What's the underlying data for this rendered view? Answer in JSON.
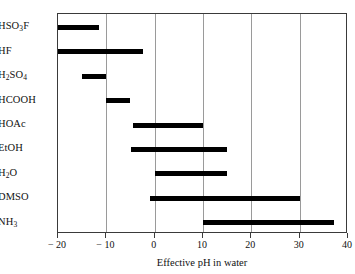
{
  "chart_data": {
    "type": "bar",
    "orientation": "horizontal-range",
    "title": "",
    "xlabel": "Effective pH in water",
    "ylabel": "",
    "xlim": [
      -20,
      40
    ],
    "xticks": [
      -20,
      -10,
      0,
      10,
      20,
      30,
      40
    ],
    "xtick_labels": [
      "− 20",
      "− 10",
      "0",
      "10",
      "20",
      "30",
      "40"
    ],
    "grid": true,
    "grid_axis": "x",
    "legend": "none",
    "bar_color": "#000000",
    "categories": [
      "HSO3F",
      "HF",
      "H2SO4",
      "HCOOH",
      "HOAc",
      "EtOH",
      "H2O",
      "DMSO",
      "NH3"
    ],
    "category_labels_html": [
      "HSO<sub>3</sub>F",
      "HF",
      "H<sub>2</sub>SO<sub>4</sub>",
      "HCOOH",
      "HOAc",
      "EtOH",
      "H<sub>2</sub>O",
      "DMSO",
      "NH<sub>3</sub>"
    ],
    "ranges": [
      {
        "label": "HSO3F",
        "start": -20,
        "end": -11.5
      },
      {
        "label": "HF",
        "start": -20,
        "end": -2.5
      },
      {
        "label": "H2SO4",
        "start": -15,
        "end": -10
      },
      {
        "label": "HCOOH",
        "start": -10,
        "end": -5
      },
      {
        "label": "HOAc",
        "start": -4.5,
        "end": 10
      },
      {
        "label": "EtOH",
        "start": -5,
        "end": 15
      },
      {
        "label": "H2O",
        "start": 0,
        "end": 15
      },
      {
        "label": "DMSO",
        "start": -1,
        "end": 30
      },
      {
        "label": "NH3",
        "start": 10,
        "end": 37
      }
    ]
  }
}
